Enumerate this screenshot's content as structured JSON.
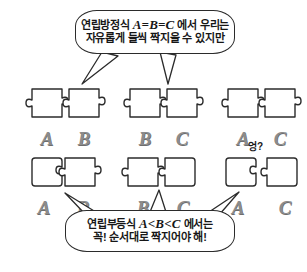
{
  "page": {
    "background_color": "#ffffff",
    "outline_color": "#2b2b2b",
    "letter_color": "#8c8c8c"
  },
  "top_bubble": {
    "name": "equation-speech-bubble",
    "line1_prefix": "연립방정식",
    "line1_math": "A=B=C",
    "line1_suffix": "에서 우리는",
    "line2": "자유롭게 둘씩 짝지을 수 있지만",
    "tail_count": 2
  },
  "bottom_bubble": {
    "name": "inequality-speech-bubble",
    "line1_prefix": "연립부등식",
    "line1_math": "A<B<C",
    "line1_suffix": "에서는",
    "line2": "꼭! 순서대로 짝지어야 해!",
    "tail_count": 3
  },
  "top_row": {
    "label": "equation-pairs",
    "pairs": [
      {
        "name": "pair-ab",
        "left": "A",
        "right": "B",
        "connected": true
      },
      {
        "name": "pair-bc",
        "left": "B",
        "right": "C",
        "connected": true
      },
      {
        "name": "pair-ac",
        "left": "A",
        "right": "C",
        "connected": true
      }
    ]
  },
  "bottom_row": {
    "label": "inequality-pairs",
    "pairs": [
      {
        "name": "pair-ab-ordered",
        "left": "A",
        "right": "B",
        "connected": true
      },
      {
        "name": "pair-bc-ordered",
        "left": "B",
        "right": "C",
        "connected": true
      },
      {
        "name": "pair-ac-mismatch",
        "left": "A",
        "right": "C",
        "connected": false,
        "annotation": "엉?"
      }
    ]
  }
}
